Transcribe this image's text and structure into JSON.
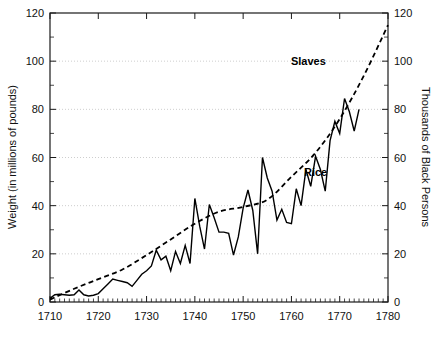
{
  "chart_data": {
    "type": "line",
    "title": "",
    "xlabel": "",
    "ylabel": "Weight (in millions of pounds)",
    "y2label": "Thousands of Black Persons",
    "xlim": [
      1710,
      1780
    ],
    "ylim": [
      0,
      120
    ],
    "y2lim": [
      0,
      120
    ],
    "xticks": [
      1710,
      1720,
      1730,
      1740,
      1750,
      1760,
      1770,
      1780
    ],
    "xticklabels": [
      "1710",
      "1720",
      "1730",
      "1740",
      "1750",
      "1760",
      "1770",
      "1780"
    ],
    "xminor_step": 1,
    "yticks": [
      0,
      20,
      40,
      60,
      80,
      100,
      120
    ],
    "yticklabels": [
      "0",
      "20",
      "40",
      "60",
      "80",
      "100",
      "120"
    ],
    "yminor_ticks": [
      10,
      30,
      50,
      70,
      90,
      110
    ],
    "y2ticks": [
      0,
      20,
      40,
      60,
      80,
      100,
      120
    ],
    "y2ticklabels": [
      "0",
      "20",
      "40",
      "60",
      "80",
      "100",
      "120"
    ],
    "grid": "horizontal-dotted at 20,40,60,80,100",
    "gridlines_y": [
      20,
      40,
      60,
      80,
      100
    ],
    "legend": "inline annotations",
    "annotations": [
      {
        "text": "Slaves",
        "x": 1763.5,
        "y": 98.5
      },
      {
        "text": "Rice",
        "x": 1765.0,
        "y": 52.5
      }
    ],
    "series": [
      {
        "name": "Rice",
        "style": "solid",
        "axis": "left",
        "units": "millions of pounds",
        "x": [
          1710,
          1711,
          1712,
          1713,
          1714,
          1715,
          1716,
          1717,
          1718,
          1719,
          1720,
          1721,
          1722,
          1723,
          1724,
          1725,
          1726,
          1727,
          1728,
          1729,
          1730,
          1731,
          1732,
          1733,
          1734,
          1735,
          1736,
          1737,
          1738,
          1739,
          1740,
          1741,
          1742,
          1743,
          1744,
          1745,
          1746,
          1747,
          1748,
          1749,
          1750,
          1751,
          1752,
          1753,
          1754,
          1755,
          1756,
          1757,
          1758,
          1759,
          1760,
          1761,
          1762,
          1763,
          1764,
          1765,
          1766,
          1767,
          1768,
          1769,
          1770,
          1771,
          1772,
          1773,
          1774
        ],
        "values": [
          1.5,
          3.0,
          3.2,
          3.0,
          2.8,
          3.0,
          5.0,
          3.0,
          2.5,
          2.8,
          3.5,
          5.5,
          7.5,
          9.5,
          9.0,
          8.5,
          8.0,
          6.5,
          9.0,
          11.5,
          13.0,
          15.0,
          21.5,
          17.5,
          19.0,
          13.0,
          21.0,
          16.0,
          23.5,
          16.0,
          43.0,
          31.5,
          22.0,
          40.5,
          35.0,
          29.0,
          29.0,
          28.5,
          19.5,
          27.0,
          39.0,
          46.5,
          38.0,
          20.0,
          60.0,
          51.5,
          46.0,
          34.0,
          38.5,
          33.0,
          32.5,
          47.0,
          40.0,
          55.0,
          48.0,
          60.5,
          55.0,
          46.0,
          67.0,
          75.0,
          70.0,
          84.5,
          79.0,
          71.0,
          80.0
        ]
      },
      {
        "name": "Slaves",
        "style": "dashed",
        "axis": "right",
        "units": "thousands of black persons",
        "x": [
          1710,
          1715,
          1720,
          1725,
          1730,
          1735,
          1740,
          1745,
          1750,
          1755,
          1760,
          1765,
          1770,
          1775,
          1780
        ],
        "values": [
          1.0,
          5.5,
          9.5,
          13.5,
          19.5,
          26.0,
          32.5,
          37.5,
          39.5,
          42.5,
          52.0,
          62.0,
          76.0,
          94.0,
          115.0
        ]
      }
    ]
  },
  "axes": {
    "left_title": "Weight (in millions of pounds)",
    "right_title": "Thousands of Black Persons"
  },
  "labels": {
    "slaves": "Slaves",
    "rice": "Rice"
  }
}
